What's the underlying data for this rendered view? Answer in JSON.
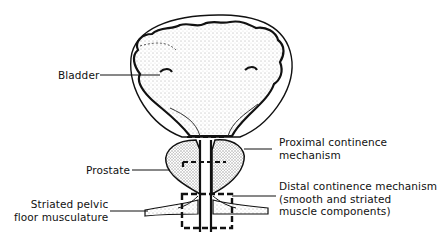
{
  "diagram": {
    "labels": {
      "bladder": {
        "lines": [
          "Bladder"
        ]
      },
      "prostate": {
        "lines": [
          "Prostate"
        ]
      },
      "striated_pelvic": {
        "lines": [
          "Striated pelvic",
          "floor musculature"
        ]
      },
      "proximal": {
        "lines": [
          "Proximal continence",
          "mechanism"
        ]
      },
      "distal": {
        "lines": [
          "Distal continence mechanism",
          "(smooth and striated",
          "muscle components)"
        ]
      }
    },
    "colors": {
      "ink": "#111111",
      "background": "#ffffff",
      "stipple": "#555555"
    }
  }
}
